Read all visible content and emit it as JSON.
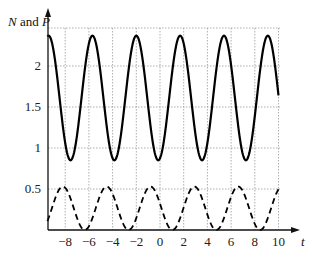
{
  "chart_data": {
    "type": "line",
    "title": "",
    "xlabel": "t",
    "ylabel": "N and P",
    "x_ticks": [
      -8,
      -6,
      -4,
      -2,
      0,
      2,
      4,
      6,
      8,
      10
    ],
    "x_tick_labels": [
      "−8",
      "−6",
      "−4",
      "−2",
      "0",
      "2",
      "4",
      "6",
      "8",
      "10"
    ],
    "y_ticks": [
      0.5,
      1,
      1.5,
      2
    ],
    "y_tick_labels": [
      "0.5",
      "1",
      "1.5",
      "2"
    ],
    "xlim": [
      -9.5,
      11.5
    ],
    "ylim": [
      0,
      2.5
    ],
    "grid": true,
    "series": [
      {
        "name": "N",
        "style": "solid",
        "color": "#000000",
        "period": 3.7,
        "max": 2.37,
        "min": 0.85,
        "peaks_t": [
          -9.4,
          -5.7,
          -2.0,
          1.7,
          5.4,
          9.2
        ]
      },
      {
        "name": "P",
        "style": "dashed",
        "color": "#000000",
        "period": 3.7,
        "max": 0.53,
        "min": 0.0,
        "peaks_t": [
          -8.2,
          -4.5,
          -0.8,
          2.9,
          6.6
        ]
      }
    ]
  }
}
